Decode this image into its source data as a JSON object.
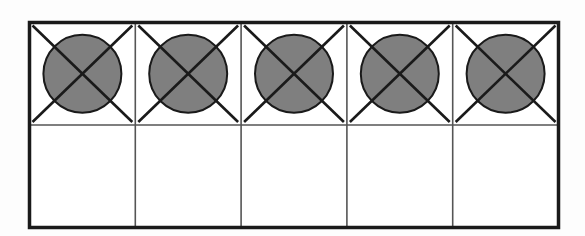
{
  "diagram": {
    "type": "ten-frame",
    "rows": 2,
    "columns": 5,
    "colors": {
      "border": "#1a1a1a",
      "grid": "#555555",
      "counter_fill": "#7f7f7f",
      "counter_stroke": "#1a1a1a",
      "cross": "#1a1a1a",
      "cell_bg": "#ffffff"
    },
    "cells": [
      {
        "row": 0,
        "col": 0,
        "counter": true,
        "crossed": true
      },
      {
        "row": 0,
        "col": 1,
        "counter": true,
        "crossed": true
      },
      {
        "row": 0,
        "col": 2,
        "counter": true,
        "crossed": true
      },
      {
        "row": 0,
        "col": 3,
        "counter": true,
        "crossed": true
      },
      {
        "row": 0,
        "col": 4,
        "counter": true,
        "crossed": true
      },
      {
        "row": 1,
        "col": 0,
        "counter": false,
        "crossed": false
      },
      {
        "row": 1,
        "col": 1,
        "counter": false,
        "crossed": false
      },
      {
        "row": 1,
        "col": 2,
        "counter": false,
        "crossed": false
      },
      {
        "row": 1,
        "col": 3,
        "counter": false,
        "crossed": false
      },
      {
        "row": 1,
        "col": 4,
        "counter": false,
        "crossed": false
      }
    ],
    "counters_total": 5,
    "counters_crossed_out": 5
  }
}
